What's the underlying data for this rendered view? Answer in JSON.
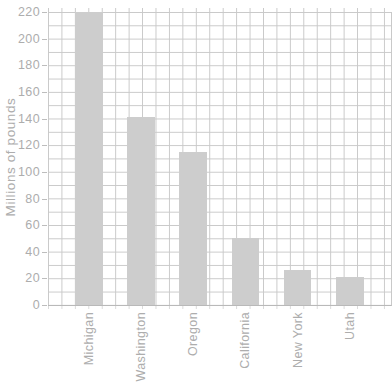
{
  "chart_data": {
    "type": "bar",
    "title": "",
    "ylabel": "Millions of pounds",
    "xlabel": "",
    "categories": [
      "Michigan",
      "Washington",
      "Oregon",
      "California",
      "New York",
      "Utah"
    ],
    "values": [
      220,
      141,
      115,
      50,
      26,
      21
    ],
    "ylim": [
      0,
      220
    ],
    "ytick_step": 20,
    "yticks": [
      0,
      20,
      40,
      60,
      80,
      100,
      120,
      140,
      160,
      180,
      200,
      220
    ],
    "grid": "graph-paper squares, minor step 10 on both axes",
    "legend_position": "none",
    "colors": {
      "bar": "#cdcdcd",
      "grid": "#c9c9c9",
      "text": "#adadad",
      "axis_tick": "#bdbdbd"
    }
  }
}
